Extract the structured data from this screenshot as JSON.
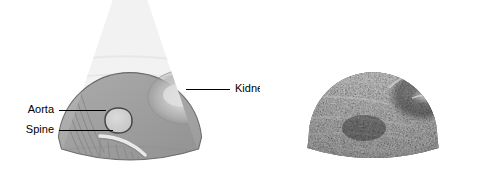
{
  "figure": {
    "background_color": "#ffffff"
  },
  "panels": [
    {
      "id": "schematic",
      "name": "schematic-sector-diagram",
      "kind": "line-drawing",
      "description": "Grey sector scan schematic with labelled anatomy",
      "fan": {
        "fill_color": "#a9a9a9",
        "outline_color": "#6e6e6e",
        "apex_x": 130,
        "apex_y": -52,
        "near_field_radius": 72,
        "far_field_radius": 222,
        "half_angle_deg": 41
      },
      "structures": [
        {
          "name": "kidney",
          "label": "Kidney",
          "shape": "ellipse",
          "cx": 185,
          "cy": 97,
          "rx": 37,
          "ry": 27,
          "fill_color": "#c9c9c9",
          "highlight_color": "#e8e8e8",
          "outline_color": "#9a9a9a"
        },
        {
          "name": "aorta",
          "label": "Aorta",
          "shape": "rounded-oval",
          "cx": 118,
          "cy": 120,
          "rx": 13,
          "ry": 12,
          "fill_color": "#dcdcdc",
          "outline_color": "#4a4a4a"
        },
        {
          "name": "spine",
          "label": "Spine",
          "shape": "bright-crescent",
          "fill_color": "#f2f2f2",
          "outline_color": "#8a8a8a",
          "acoustic_shadow": true,
          "shadow_line_count": 7
        },
        {
          "name": "tissue-planes",
          "label": "",
          "shape": "streak-lines",
          "line_count": 5,
          "outline_color": "#8d8d8d"
        }
      ],
      "labels": [
        {
          "id": "aorta",
          "text": "Aorta",
          "text_x": 54,
          "text_y": 110,
          "anchor": "end",
          "leader_x1": 59,
          "leader_y1": 110,
          "leader_x2": 106,
          "leader_y2": 110
        },
        {
          "id": "spine",
          "text": "Spine",
          "text_x": 54,
          "text_y": 130,
          "anchor": "end",
          "leader_x1": 59,
          "leader_y1": 130,
          "leader_x2": 113,
          "leader_y2": 130
        },
        {
          "id": "kidney",
          "text": "Kidney",
          "text_x": 235,
          "text_y": 89,
          "anchor": "start",
          "leader_x1": 186,
          "leader_y1": 89,
          "leader_x2": 230,
          "leader_y2": 89
        }
      ]
    },
    {
      "id": "ultrasound",
      "name": "bmode-ultrasound-scan",
      "kind": "photograph",
      "description": "Greyscale B-mode sector ultrasound of the abdomen showing kidney",
      "fan": {
        "fill_color": "#111111",
        "apex_x": 113,
        "apex_y": -44,
        "near_field_radius": 64,
        "far_field_radius": 222,
        "half_angle_deg": 40
      },
      "features": [
        {
          "name": "kidney-region",
          "cx": 163,
          "cy": 95,
          "rx": 34,
          "ry": 25,
          "tone": "hypoechoic"
        },
        {
          "name": "central-echo-complex",
          "cx": 165,
          "cy": 95,
          "rx": 14,
          "ry": 8,
          "tone": "hyperechoic"
        },
        {
          "name": "near-field-fascial-layers",
          "tone": "hyperechoic"
        },
        {
          "name": "speckle-texture",
          "tone": "mixed"
        }
      ]
    }
  ]
}
